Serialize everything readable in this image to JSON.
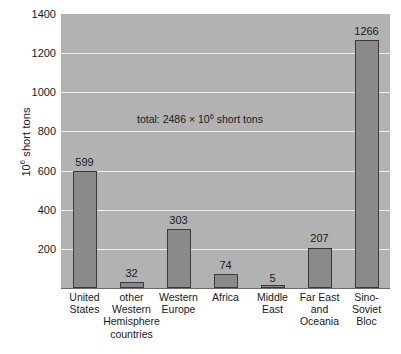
{
  "chart_data": {
    "type": "bar",
    "title": "",
    "subtitle": "",
    "xlabel": "",
    "ylabel": "10⁶ short tons",
    "ylabel_base": "10",
    "ylabel_exp": "6",
    "ylabel_rest": " short tons",
    "ylim": [
      0,
      1400
    ],
    "yticks": [
      200,
      400,
      600,
      800,
      1000,
      1200,
      1400
    ],
    "ytick_labels": [
      "200",
      "400",
      "600",
      "800",
      "1000",
      "1200",
      "1400"
    ],
    "grid": true,
    "legend": "none",
    "categories": [
      "United States",
      "other Western Hemisphere countries",
      "Western Europe",
      "Africa",
      "Middle East",
      "Far East and Oceania",
      "Sino-Soviet Bloc"
    ],
    "category_label_lines": [
      [
        "United",
        "States"
      ],
      [
        "other",
        "Western",
        "Hemisphere",
        "countries"
      ],
      [
        "Western",
        "Europe"
      ],
      [
        "Africa"
      ],
      [
        "Middle",
        "East"
      ],
      [
        "Far East",
        "and",
        "Oceania"
      ],
      [
        "Sino-",
        "Soviet",
        "Bloc"
      ]
    ],
    "values": [
      599,
      32,
      303,
      74,
      5,
      207,
      1266
    ],
    "value_labels": [
      "599",
      "32",
      "303",
      "74",
      "5",
      "207",
      "1266"
    ],
    "annotations": [
      {
        "text": "total: 2486 × 10⁶ short tons",
        "prefix": "total: 2486 × 10",
        "exp": "6",
        "suffix": " short tons",
        "x_px": 137,
        "y_px": 113
      }
    ],
    "colors": {
      "plot_background": "#b2b2b2",
      "bar_fill": "#8a8a8a",
      "bar_stroke": "#3a3a3a",
      "gridline": "#efefef",
      "axis": "#6b6b6b",
      "text": "#1a1a1a",
      "page_background": "#ffffff"
    }
  }
}
